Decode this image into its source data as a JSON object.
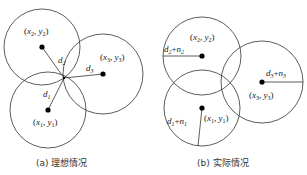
{
  "panels": [
    {
      "id": "a",
      "caption": "(a) 理想情况",
      "circles": [
        {
          "label_var": "x",
          "label_var2": "y",
          "sub": "1",
          "center": [
            48,
            110
          ],
          "r": 38,
          "distance": "d",
          "dsub": "1"
        },
        {
          "label_var": "x",
          "label_var2": "y",
          "sub": "2",
          "center": [
            42,
            47
          ],
          "r": 38,
          "distance": "d",
          "dsub": "2"
        },
        {
          "label_var": "x",
          "label_var2": "y",
          "sub": "3",
          "center": [
            103,
            74
          ],
          "r": 40,
          "distance": "d",
          "dsub": "3"
        }
      ],
      "intersection": [
        64,
        78
      ]
    },
    {
      "id": "b",
      "caption": "(b) 实际情况",
      "circles": [
        {
          "label_var": "x",
          "label_var2": "y",
          "sub": "1",
          "center": [
            202,
            108
          ],
          "r": 38,
          "radius_label": "d₁+n₁"
        },
        {
          "label_var": "x",
          "label_var2": "y",
          "sub": "2",
          "center": [
            202,
            56
          ],
          "r": 39,
          "radius_label": "d₂+n₂"
        },
        {
          "label_var": "x",
          "label_var2": "y",
          "sub": "3",
          "center": [
            262,
            82
          ],
          "r": 41,
          "radius_label": "d₃+n₃"
        }
      ]
    }
  ],
  "text": {
    "a_c1": [
      "(",
      "x",
      "1",
      ", ",
      "y",
      "1",
      ")"
    ],
    "a_c2": [
      "(",
      "x",
      "2",
      ", ",
      "y",
      "2",
      ")"
    ],
    "a_c3": [
      "(",
      "x",
      "3",
      ", ",
      "y",
      "3",
      ")"
    ],
    "d": "d",
    "n": "n",
    "plus": "+",
    "s1": "1",
    "s2": "2",
    "s3": "3",
    "open": "(",
    "comma": ", ",
    "close": ")",
    "x": "x",
    "y": "y",
    "caption_a": "(a) 理想情况",
    "caption_b": "(b) 实际情况"
  },
  "colors": {
    "stroke": "#333333",
    "dot": "#000000",
    "text": "#222222"
  }
}
